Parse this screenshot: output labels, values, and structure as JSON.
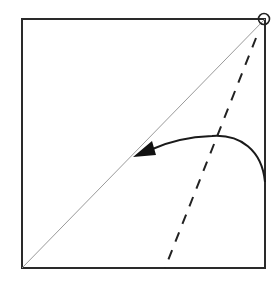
{
  "diagram": {
    "type": "origami-fold-step",
    "colors": {
      "paper_edge": "#2a2a2a",
      "crease": "#9a9a9a",
      "fold_line": "#222222",
      "arrow": "#1a1a1a",
      "background": "#ffffff"
    },
    "elements": {
      "square": {
        "x": 22,
        "y": 19,
        "size": 244
      },
      "diagonal_crease": {
        "x1": 22,
        "y1": 268,
        "x2": 265,
        "y2": 19
      },
      "valley_fold": {
        "x1": 255,
        "y1": 40,
        "x2": 165,
        "y2": 268,
        "style": "dashed"
      },
      "pivot_marker": {
        "cx": 265,
        "cy": 19,
        "r": 6
      },
      "fold_arrow": {
        "start": [
          265,
          180
        ],
        "end": [
          136,
          155
        ]
      }
    }
  }
}
